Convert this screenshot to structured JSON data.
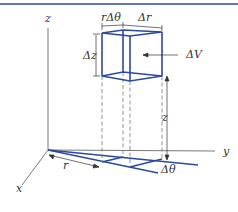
{
  "figure": {
    "type": "cylindrical volume element diagram",
    "colors": {
      "accent": "#2b4a9a",
      "axes": "#555555",
      "dashes": "#777777"
    },
    "labels": {
      "z_axis": "z",
      "y_axis": "y",
      "x_axis": "x",
      "r_delta_theta": "rΔθ",
      "delta_r": "Δr",
      "delta_z": "Δz",
      "delta_v": "ΔV",
      "height_z": "z",
      "radius_r": "r",
      "delta_theta": "Δθ"
    }
  }
}
